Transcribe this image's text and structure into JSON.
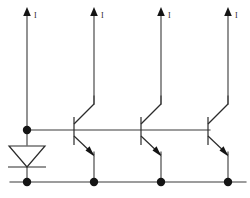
{
  "diagram": {
    "type": "circuit-schematic",
    "colors": {
      "wire": "#3a3a3a",
      "symbol": "#2b2b2b",
      "node": "#141414",
      "background": "#ffffff",
      "caption": "#d8d8d8"
    },
    "caption": "",
    "current_sources": [
      {
        "id": "ref",
        "label": "I",
        "x": 27,
        "arrow_y": 12
      },
      {
        "id": "out1",
        "label": "I",
        "x": 94,
        "arrow_y": 12
      },
      {
        "id": "out2",
        "label": "I",
        "x": 161,
        "arrow_y": 12
      },
      {
        "id": "out3",
        "label": "I",
        "x": 228,
        "arrow_y": 12
      }
    ],
    "reference_branch": {
      "name": "diode-connected reference",
      "device": "diode",
      "x": 27,
      "top_node_y": 130,
      "bottom_node_y": 182
    },
    "transistors": [
      {
        "id": "q1",
        "type": "npn",
        "base_x": 74,
        "collector_x": 94,
        "emitter_x": 94,
        "base_y": 130
      },
      {
        "id": "q2",
        "type": "npn",
        "base_x": 141,
        "collector_x": 161,
        "emitter_x": 161,
        "base_y": 130
      },
      {
        "id": "q3",
        "type": "npn",
        "base_x": 208,
        "collector_x": 228,
        "emitter_x": 228,
        "base_y": 130
      }
    ],
    "rails": {
      "base_rail": {
        "name": "common base rail",
        "y": 130,
        "x1": 27,
        "x2": 208
      },
      "ground_rail": {
        "name": "common emitter / ground rail",
        "y": 182,
        "x1": 10,
        "x2": 245
      }
    },
    "nodes": [
      {
        "name": "base-node",
        "x": 27,
        "y": 130
      },
      {
        "name": "gnd-node-ref",
        "x": 27,
        "y": 182
      },
      {
        "name": "gnd-node-q1",
        "x": 94,
        "y": 182
      },
      {
        "name": "gnd-node-q2",
        "x": 161,
        "y": 182
      },
      {
        "name": "gnd-node-q3",
        "x": 228,
        "y": 182
      }
    ]
  }
}
